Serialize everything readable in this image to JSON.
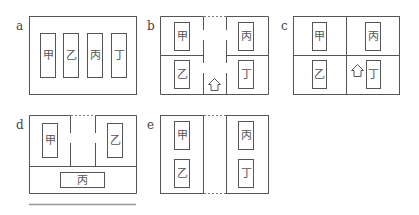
{
  "panels": {
    "a": {
      "label": "a",
      "rooms": [
        "甲",
        "乙",
        "丙",
        "丁"
      ]
    },
    "b": {
      "label": "b",
      "rooms": [
        "甲",
        "丙",
        "乙",
        "丁"
      ]
    },
    "c": {
      "label": "c",
      "rooms": [
        "甲",
        "丙",
        "乙",
        "丁"
      ]
    },
    "d": {
      "label": "d",
      "rooms": [
        "甲",
        "乙",
        "丙"
      ]
    },
    "e": {
      "label": "e",
      "rooms": [
        "甲",
        "丙",
        "乙",
        "丁"
      ]
    }
  }
}
